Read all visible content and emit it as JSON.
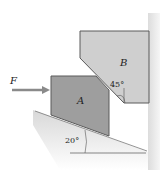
{
  "diagram": {
    "labels": {
      "force": "F",
      "block_a": "A",
      "block_b": "B",
      "angle_wedge": "45°",
      "angle_incline": "20°"
    },
    "colors": {
      "block_a_fill": "#9e9e9e",
      "block_b_fill": "#cfcfcf",
      "outline": "#5a5a5a",
      "wall_fill": "#e6e6e6",
      "ground_fill": "#dcdcdc",
      "arrow": "#8a8a8a",
      "text": "#222222"
    }
  }
}
